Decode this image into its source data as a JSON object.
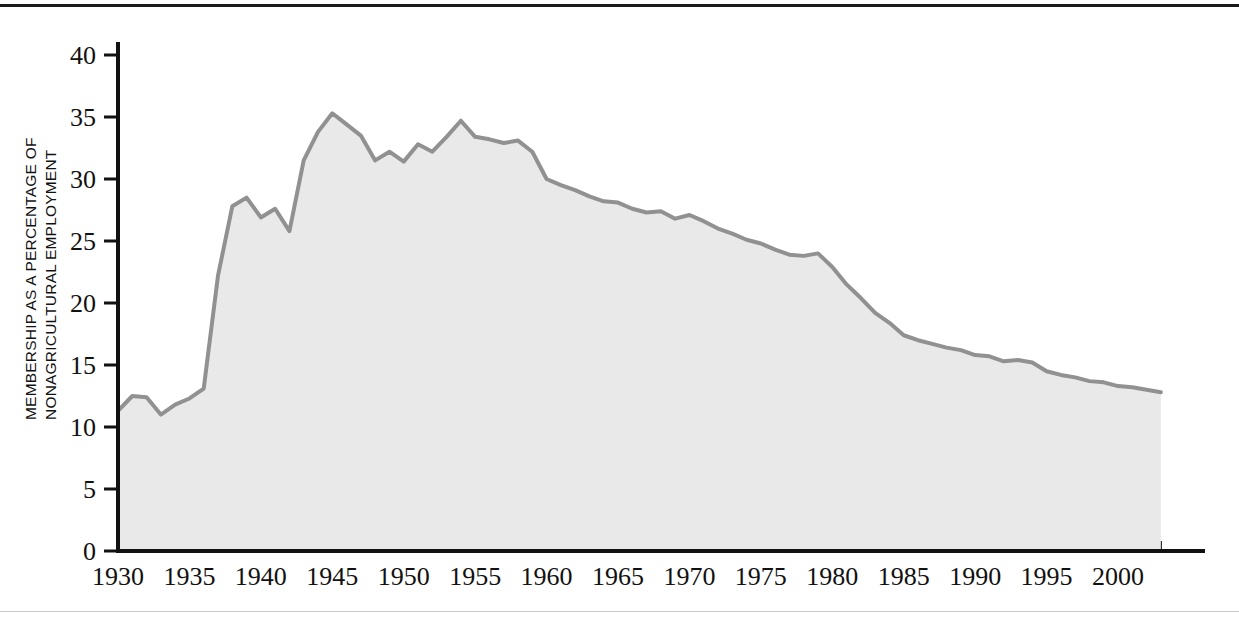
{
  "figure": {
    "background_color": "#ffffff",
    "top_rule_color": "#1a1a1a",
    "bottom_rule_color": "#c9c9c9"
  },
  "axis": {
    "y_label_line1": "MEMBERSHIP AS A PERCENTAGE OF",
    "y_label_line2": "NONAGRICULTURAL EMPLOYMENT",
    "y_ticks": [
      "0",
      "5",
      "10",
      "15",
      "20",
      "25",
      "30",
      "35",
      "40"
    ],
    "x_ticks": [
      "1930",
      "1935",
      "1940",
      "1945",
      "1950",
      "1955",
      "1960",
      "1965",
      "1970",
      "1975",
      "1980",
      "1985",
      "1990",
      "1995",
      "2000"
    ],
    "axis_color": "#111111"
  },
  "style": {
    "line_color": "#919191",
    "fill_color": "#e9e9e9",
    "line_width": 4
  },
  "chart_data": {
    "type": "area",
    "title": "",
    "subtitle": "",
    "xlabel": "",
    "ylabel": "MEMBERSHIP AS A PERCENTAGE OF NONAGRICULTURAL EMPLOYMENT",
    "xlim": [
      1930,
      2003
    ],
    "ylim": [
      0,
      40
    ],
    "ytick_values": [
      0,
      5,
      10,
      15,
      20,
      25,
      30,
      35,
      40
    ],
    "xtick_values": [
      1930,
      1935,
      1940,
      1945,
      1950,
      1955,
      1960,
      1965,
      1970,
      1975,
      1980,
      1985,
      1990,
      1995,
      2000
    ],
    "minor_xtick_interval": 1,
    "grid": false,
    "legend": false,
    "legend_position": "none",
    "annotations": [],
    "series": [
      {
        "name": "Union membership as a percentage of nonagricultural employment",
        "x": [
          1930,
          1931,
          1932,
          1933,
          1934,
          1935,
          1936,
          1937,
          1938,
          1939,
          1940,
          1941,
          1942,
          1943,
          1944,
          1945,
          1946,
          1947,
          1948,
          1949,
          1950,
          1951,
          1952,
          1953,
          1954,
          1955,
          1956,
          1957,
          1958,
          1959,
          1960,
          1961,
          1962,
          1963,
          1964,
          1965,
          1966,
          1967,
          1968,
          1969,
          1970,
          1971,
          1972,
          1973,
          1974,
          1975,
          1976,
          1977,
          1978,
          1979,
          1980,
          1981,
          1982,
          1983,
          1984,
          1985,
          1986,
          1987,
          1988,
          1989,
          1990,
          1991,
          1992,
          1993,
          1994,
          1995,
          1996,
          1997,
          1998,
          1999,
          2000,
          2001,
          2002,
          2003
        ],
        "values": [
          11.3,
          12.5,
          12.4,
          11.0,
          11.8,
          12.3,
          13.1,
          22.2,
          27.8,
          28.5,
          26.9,
          27.6,
          25.8,
          31.5,
          33.8,
          35.3,
          34.4,
          33.5,
          31.5,
          32.2,
          31.4,
          32.8,
          32.2,
          33.4,
          34.7,
          33.4,
          33.2,
          32.9,
          33.1,
          32.2,
          30.0,
          29.5,
          29.1,
          28.6,
          28.2,
          28.1,
          27.6,
          27.3,
          27.4,
          26.8,
          27.1,
          26.6,
          26.0,
          25.6,
          25.1,
          24.8,
          24.3,
          23.9,
          23.8,
          24.0,
          22.9,
          21.5,
          20.4,
          19.2,
          18.4,
          17.4,
          17.0,
          16.7,
          16.4,
          16.2,
          15.8,
          15.7,
          15.3,
          15.4,
          15.2,
          14.5,
          14.2,
          14.0,
          13.7,
          13.6,
          13.3,
          13.2,
          13.0,
          12.8
        ]
      }
    ]
  }
}
